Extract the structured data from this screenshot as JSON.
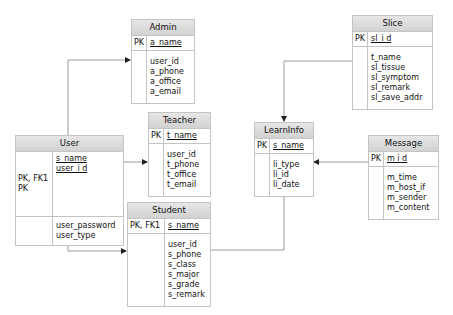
{
  "entities": {
    "admin": {
      "title": "Admin",
      "pk_keys": [
        "PK"
      ],
      "pk_fields": [
        "a_name"
      ],
      "fields": [
        "user_id",
        "a_phone",
        "a_office",
        "a_email"
      ]
    },
    "teacher": {
      "title": "Teacher",
      "pk_keys": [
        "PK"
      ],
      "pk_fields": [
        "t_name"
      ],
      "fields": [
        "user_id",
        "t_phone",
        "t_office",
        "t_email"
      ]
    },
    "user": {
      "title": "User",
      "pk_keys": [
        "PK, FK1",
        "PK"
      ],
      "pk_fields": [
        "s_name",
        "user_i d"
      ],
      "fields": [
        "user_password",
        "user_type"
      ]
    },
    "student": {
      "title": "Student",
      "pk_keys": [
        "PK, FK1"
      ],
      "pk_fields": [
        "s_name"
      ],
      "fields": [
        "user_id",
        "s_phone",
        "s_class",
        "s_major",
        "s_grade",
        "s_remark"
      ]
    },
    "learninfo": {
      "title": "LearnInfo",
      "pk_keys": [
        "PK"
      ],
      "pk_fields": [
        "s_name"
      ],
      "fields": [
        "li_type",
        "li_id",
        "li_date"
      ]
    },
    "slice": {
      "title": "Slice",
      "pk_keys": [
        "PK"
      ],
      "pk_fields": [
        "sl_i d"
      ],
      "fields": [
        "t_name",
        "sl_tissue",
        "sl_symptom",
        "sl_remark",
        "sl_save_addr"
      ]
    },
    "message": {
      "title": "Message",
      "pk_keys": [
        "PK"
      ],
      "pk_fields": [
        "m i d"
      ],
      "fields": [
        "m_time",
        "m_host_if",
        "m_sender",
        "m_content"
      ]
    }
  },
  "relationships": [
    {
      "from": "User",
      "to": "Admin"
    },
    {
      "from": "User",
      "to": "Teacher"
    },
    {
      "from": "User",
      "to": "Student"
    },
    {
      "from": "Student",
      "to": "LearnInfo"
    },
    {
      "from": "Slice",
      "to": "LearnInfo"
    },
    {
      "from": "Message",
      "to": "LearnInfo"
    }
  ],
  "colors": {
    "header_bg": "#d9d9d9",
    "border": "#c4c4c4",
    "line": "#9a9a9a"
  }
}
